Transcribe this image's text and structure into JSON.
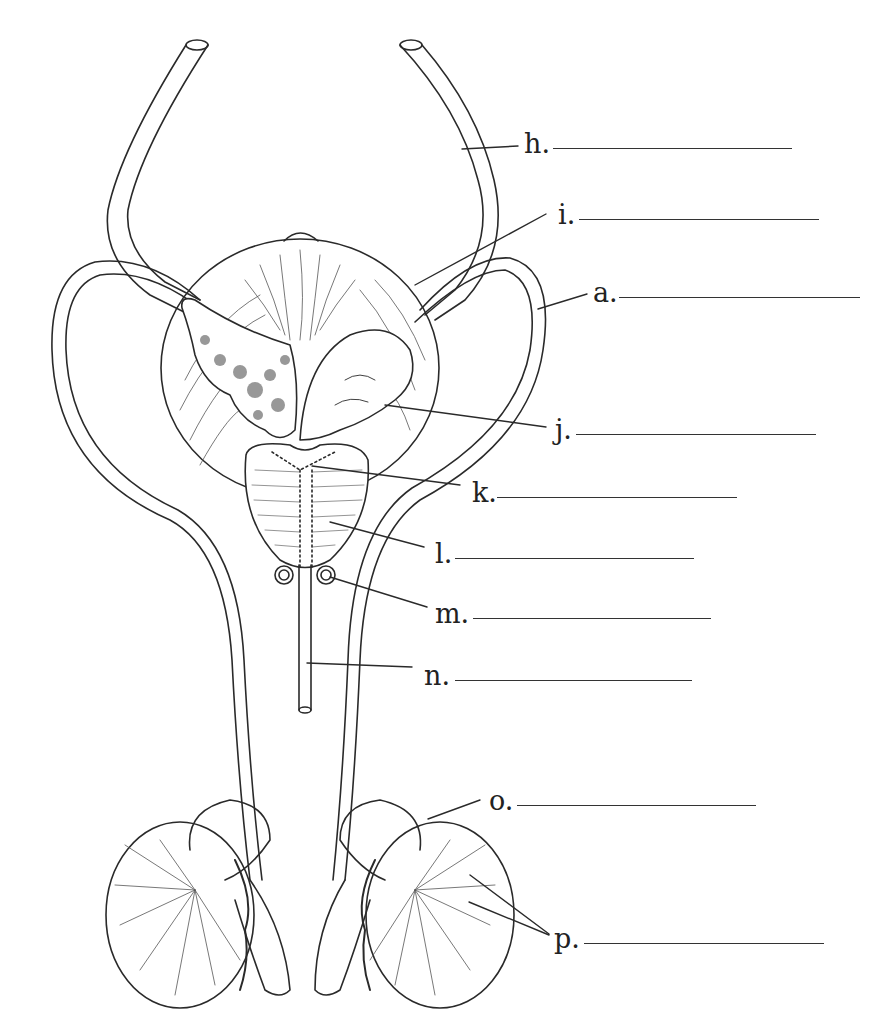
{
  "diagram": {
    "line_color": "#2a2a2a",
    "background": "#ffffff",
    "labels": [
      {
        "id": "h",
        "text": "h.",
        "x": 524,
        "y": 148,
        "blank_x1": 553,
        "blank_x2": 792,
        "blank_y": 148,
        "pointer": [
          [
            462,
            149
          ],
          [
            518,
            146
          ]
        ]
      },
      {
        "id": "i",
        "text": "i.",
        "x": 558,
        "y": 219,
        "blank_x1": 579,
        "blank_x2": 819,
        "blank_y": 219,
        "pointer": [
          [
            415,
            285
          ],
          [
            546,
            214
          ]
        ]
      },
      {
        "id": "a",
        "text": "a.",
        "x": 593,
        "y": 297,
        "blank_x1": 619,
        "blank_x2": 860,
        "blank_y": 297,
        "pointer": [
          [
            538,
            309
          ],
          [
            587,
            294
          ]
        ]
      },
      {
        "id": "j",
        "text": "j.",
        "x": 555,
        "y": 434,
        "blank_x1": 576,
        "blank_x2": 816,
        "blank_y": 434,
        "pointer": [
          [
            385,
            405
          ],
          [
            546,
            427
          ]
        ]
      },
      {
        "id": "k",
        "text": "k.",
        "x": 472,
        "y": 497,
        "blank_x1": 497,
        "blank_x2": 737,
        "blank_y": 497,
        "pointer": [
          [
            312,
            466
          ],
          [
            460,
            485
          ]
        ]
      },
      {
        "id": "l",
        "text": "l.",
        "x": 435,
        "y": 558,
        "blank_x1": 455,
        "blank_x2": 694,
        "blank_y": 558,
        "pointer": [
          [
            330,
            522
          ],
          [
            424,
            547
          ]
        ]
      },
      {
        "id": "m",
        "text": "m.",
        "x": 435,
        "y": 618,
        "blank_x1": 473,
        "blank_x2": 711,
        "blank_y": 618,
        "pointer": [
          [
            330,
            577
          ],
          [
            427,
            607
          ]
        ]
      },
      {
        "id": "n",
        "text": "n.",
        "x": 424,
        "y": 680,
        "blank_x1": 455,
        "blank_x2": 692,
        "blank_y": 680,
        "pointer": [
          [
            307,
            663
          ],
          [
            412,
            667
          ]
        ]
      },
      {
        "id": "o",
        "text": "o.",
        "x": 489,
        "y": 805,
        "blank_x1": 517,
        "blank_x2": 756,
        "blank_y": 805,
        "pointer": [
          [
            428,
            819
          ],
          [
            480,
            800
          ]
        ]
      },
      {
        "id": "p",
        "text": "p.",
        "x": 554,
        "y": 943,
        "blank_x1": 584,
        "blank_x2": 824,
        "blank_y": 943,
        "pointer": [
          [
            470,
            875
          ],
          [
            549,
            934
          ],
          [
            469,
            902
          ],
          [
            549,
            935
          ]
        ]
      }
    ]
  }
}
